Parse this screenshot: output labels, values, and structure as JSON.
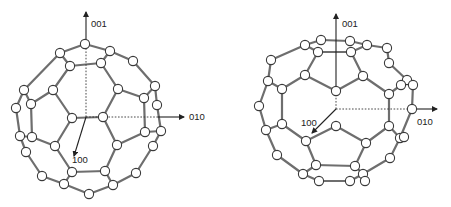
{
  "figures": [
    {
      "name": "c60-left",
      "labels": {
        "axis_z": "001",
        "axis_y": "010",
        "axis_x": "100"
      },
      "axes": {
        "origin": [
          86,
          117
        ],
        "z_dash_end": [
          86,
          47
        ],
        "z_solid_end": [
          86,
          12
        ],
        "y_dash_end": [
          158,
          117
        ],
        "y_solid_end": [
          184,
          117
        ],
        "x_end": [
          74,
          156
        ]
      },
      "label_pos": {
        "axis_z": [
          91,
          27
        ],
        "axis_y": [
          189,
          120
        ],
        "axis_x": [
          72,
          163
        ]
      },
      "atoms": [
        [
          85,
          44
        ],
        [
          60,
          53
        ],
        [
          110,
          51
        ],
        [
          70,
          66
        ],
        [
          101,
          63
        ],
        [
          133,
          61
        ],
        [
          53,
          90
        ],
        [
          118,
          89
        ],
        [
          24,
          90
        ],
        [
          155,
          86
        ],
        [
          31,
          104
        ],
        [
          144,
          98
        ],
        [
          16,
          108
        ],
        [
          157,
          105
        ],
        [
          72,
          118
        ],
        [
          103,
          117
        ],
        [
          20,
          136
        ],
        [
          32,
          137
        ],
        [
          145,
          132
        ],
        [
          161,
          131
        ],
        [
          55,
          146
        ],
        [
          117,
          145
        ],
        [
          26,
          152
        ],
        [
          153,
          146
        ],
        [
          72,
          172
        ],
        [
          105,
          171
        ],
        [
          42,
          176
        ],
        [
          136,
          173
        ],
        [
          64,
          184
        ],
        [
          113,
          185
        ],
        [
          89,
          194
        ]
      ],
      "bonds": [
        [
          0,
          1
        ],
        [
          0,
          2
        ],
        [
          1,
          3
        ],
        [
          2,
          4
        ],
        [
          3,
          4
        ],
        [
          2,
          5
        ],
        [
          1,
          8
        ],
        [
          3,
          6
        ],
        [
          4,
          7
        ],
        [
          5,
          9
        ],
        [
          9,
          11
        ],
        [
          7,
          11
        ],
        [
          6,
          10
        ],
        [
          8,
          10
        ],
        [
          8,
          12
        ],
        [
          9,
          13
        ],
        [
          6,
          14
        ],
        [
          7,
          15
        ],
        [
          14,
          15
        ],
        [
          10,
          17
        ],
        [
          12,
          16
        ],
        [
          11,
          18
        ],
        [
          13,
          19
        ],
        [
          18,
          19
        ],
        [
          16,
          22
        ],
        [
          17,
          20
        ],
        [
          14,
          20
        ],
        [
          15,
          21
        ],
        [
          21,
          18
        ],
        [
          19,
          23
        ],
        [
          20,
          24
        ],
        [
          21,
          25
        ],
        [
          24,
          25
        ],
        [
          22,
          26
        ],
        [
          23,
          27
        ],
        [
          26,
          28
        ],
        [
          24,
          28
        ],
        [
          25,
          29
        ],
        [
          27,
          29
        ],
        [
          28,
          30
        ],
        [
          29,
          30
        ],
        [
          16,
          17
        ]
      ]
    },
    {
      "name": "c60-right",
      "labels": {
        "axis_z": "001",
        "axis_y": "010",
        "axis_x": "100"
      },
      "axes": {
        "origin": [
          336,
          109
        ],
        "z_dash_end": [
          336,
          92
        ],
        "z_solid_end": [
          336,
          14
        ],
        "y_dash_end": [
          410,
          109
        ],
        "y_solid_end": [
          437,
          109
        ],
        "x_end": [
          312,
          133
        ]
      },
      "label_pos": {
        "axis_z": [
          342,
          27
        ],
        "axis_y": [
          417,
          125
        ],
        "axis_x": [
          301,
          126
        ]
      },
      "atoms": [
        [
          321,
          40
        ],
        [
          350,
          41
        ],
        [
          305,
          45
        ],
        [
          367,
          45
        ],
        [
          318,
          52
        ],
        [
          351,
          52
        ],
        [
          387,
          48
        ],
        [
          271,
          60
        ],
        [
          389,
          63
        ],
        [
          407,
          80
        ],
        [
          305,
          75
        ],
        [
          363,
          76
        ],
        [
          268,
          81
        ],
        [
          282,
          89
        ],
        [
          336,
          91
        ],
        [
          389,
          94
        ],
        [
          401,
          85
        ],
        [
          413,
          85
        ],
        [
          259,
          106
        ],
        [
          412,
          109
        ],
        [
          266,
          130
        ],
        [
          282,
          124
        ],
        [
          336,
          126
        ],
        [
          389,
          126
        ],
        [
          400,
          138
        ],
        [
          404,
          137
        ],
        [
          306,
          141
        ],
        [
          366,
          143
        ],
        [
          277,
          155
        ],
        [
          390,
          158
        ],
        [
          316,
          165
        ],
        [
          355,
          166
        ],
        [
          303,
          174
        ],
        [
          363,
          174
        ],
        [
          319,
          181
        ],
        [
          350,
          181
        ],
        [
          365,
          181
        ]
      ],
      "bonds": [
        [
          0,
          1
        ],
        [
          0,
          2
        ],
        [
          1,
          3
        ],
        [
          2,
          4
        ],
        [
          3,
          5
        ],
        [
          4,
          5
        ],
        [
          3,
          6
        ],
        [
          2,
          7
        ],
        [
          4,
          10
        ],
        [
          5,
          11
        ],
        [
          6,
          8
        ],
        [
          8,
          9
        ],
        [
          10,
          13
        ],
        [
          10,
          14
        ],
        [
          11,
          14
        ],
        [
          11,
          15
        ],
        [
          7,
          12
        ],
        [
          12,
          13
        ],
        [
          12,
          18
        ],
        [
          9,
          16
        ],
        [
          9,
          17
        ],
        [
          15,
          16
        ],
        [
          17,
          19
        ],
        [
          13,
          21
        ],
        [
          18,
          20
        ],
        [
          20,
          21
        ],
        [
          15,
          23
        ],
        [
          19,
          24
        ],
        [
          23,
          24
        ],
        [
          21,
          26
        ],
        [
          22,
          26
        ],
        [
          22,
          27
        ],
        [
          23,
          27
        ],
        [
          20,
          28
        ],
        [
          24,
          29
        ],
        [
          26,
          30
        ],
        [
          27,
          31
        ],
        [
          30,
          31
        ],
        [
          28,
          32
        ],
        [
          29,
          33
        ],
        [
          30,
          32
        ],
        [
          31,
          33
        ],
        [
          32,
          34
        ],
        [
          33,
          35
        ],
        [
          34,
          35
        ]
      ]
    }
  ]
}
